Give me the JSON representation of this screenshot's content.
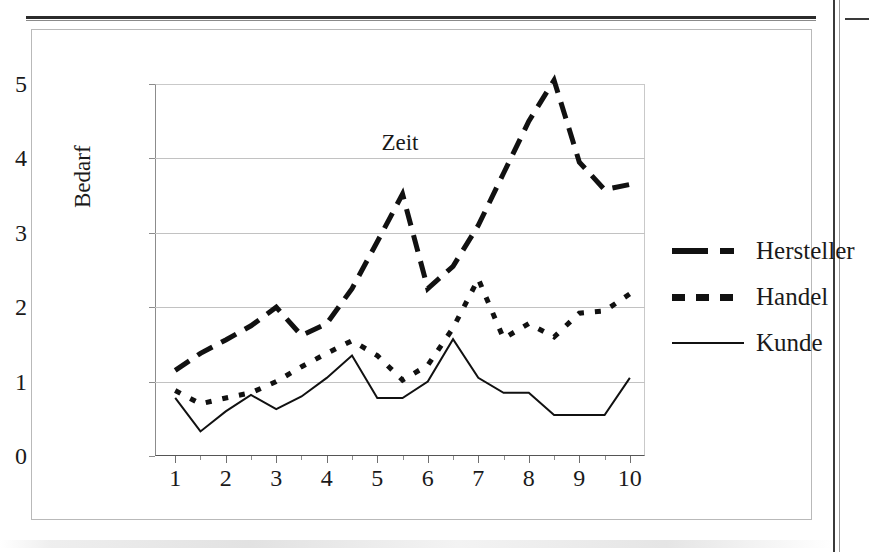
{
  "page": {
    "figure_border_color": "#b9b9b9",
    "ink_color": "#111111",
    "gridline_color": "#c2c2c2"
  },
  "chart_data": {
    "type": "line",
    "title": "",
    "xlabel": "Zeit",
    "ylabel": "Bedarf",
    "xlim": [
      0.6,
      10.3
    ],
    "ylim": [
      0,
      5
    ],
    "yticks": [
      0,
      1,
      2,
      3,
      4,
      5
    ],
    "xticks": [
      1,
      2,
      3,
      4,
      5,
      6,
      7,
      8,
      9,
      10
    ],
    "minor_xticks": [
      1.5,
      2.5,
      3.5,
      4.5,
      5.5,
      6.5,
      7.5,
      8.5,
      9.5
    ],
    "grid": "horizontal",
    "legend_position": "right",
    "x": [
      1,
      1.5,
      2,
      2.5,
      3,
      3.5,
      4,
      4.5,
      5,
      5.5,
      6,
      6.5,
      7,
      7.5,
      8,
      8.5,
      9,
      9.5,
      10
    ],
    "series": [
      {
        "name": "Hersteller",
        "style": "thick-long-dash",
        "linewidth": 5,
        "color": "#111111",
        "values": [
          1.15,
          1.38,
          1.56,
          1.75,
          2.0,
          1.62,
          1.78,
          2.25,
          2.88,
          3.52,
          2.25,
          2.55,
          3.1,
          3.8,
          4.5,
          5.05,
          3.95,
          3.58,
          3.65
        ]
      },
      {
        "name": "Handel",
        "style": "thick-short-dash",
        "linewidth": 5,
        "color": "#111111",
        "values": [
          0.88,
          0.7,
          0.78,
          0.85,
          1.0,
          1.2,
          1.38,
          1.55,
          1.35,
          1.02,
          1.22,
          1.72,
          2.38,
          1.58,
          1.78,
          1.6,
          1.92,
          1.95,
          2.18
        ]
      },
      {
        "name": "Kunde",
        "style": "thin-solid",
        "linewidth": 2,
        "color": "#111111",
        "values": [
          0.78,
          0.33,
          0.6,
          0.82,
          0.63,
          0.8,
          1.05,
          1.35,
          0.78,
          0.78,
          1.0,
          1.57,
          1.05,
          0.85,
          0.85,
          0.55,
          0.55,
          0.55,
          1.05
        ]
      }
    ]
  },
  "axes": {
    "y_tick_labels": [
      "0",
      "1",
      "2",
      "3",
      "4",
      "5"
    ],
    "x_tick_labels": [
      "1",
      "2",
      "3",
      "4",
      "5",
      "6",
      "7",
      "8",
      "9",
      "10"
    ],
    "y_title": "Bedarf",
    "x_title": "Zeit"
  },
  "legend": {
    "items": [
      {
        "label": "Hersteller",
        "key": "thick-long-dash-key"
      },
      {
        "label": "Handel",
        "key": "thick-short-dash-key"
      },
      {
        "label": "Kunde",
        "key": "thin-solid-key"
      }
    ]
  }
}
